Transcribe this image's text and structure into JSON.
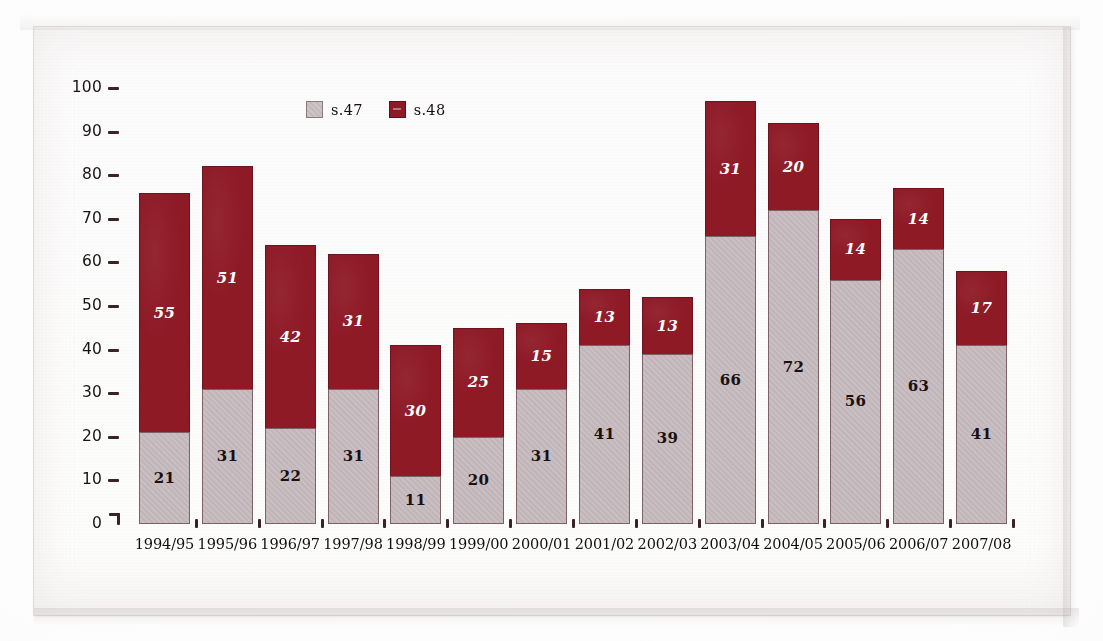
{
  "chart_data": {
    "type": "bar",
    "subtype": "stacked-bar",
    "title": "",
    "subtitle": "",
    "xlabel": "",
    "ylabel": "",
    "ylim": [
      0,
      100
    ],
    "yticks": [
      0,
      10,
      20,
      30,
      40,
      50,
      60,
      70,
      80,
      90,
      100
    ],
    "ytick_labels": [
      "0",
      "10",
      "20",
      "30",
      "40",
      "50",
      "60",
      "70",
      "80",
      "90",
      "100"
    ],
    "grid": false,
    "legend_position": "top-left-inside",
    "categories": [
      "1994/95",
      "1995/96",
      "1996/97",
      "1997/98",
      "1998/99",
      "1999/00",
      "2000/01",
      "2001/02",
      "2002/03",
      "2003/04",
      "2004/05",
      "2005/06",
      "2006/07",
      "2007/08"
    ],
    "series": [
      {
        "name": "s.47",
        "color": "#c9bfc2",
        "values": [
          21,
          31,
          22,
          31,
          11,
          20,
          31,
          41,
          39,
          66,
          72,
          56,
          63,
          41
        ]
      },
      {
        "name": "s.48",
        "color": "#8e1a26",
        "values": [
          55,
          51,
          42,
          31,
          30,
          25,
          15,
          13,
          13,
          31,
          20,
          14,
          14,
          17
        ]
      }
    ],
    "totals": [
      76,
      82,
      64,
      62,
      41,
      45,
      46,
      54,
      52,
      97,
      92,
      70,
      77,
      58
    ]
  },
  "legend": {
    "items": [
      {
        "label": "s.47",
        "swatch": "light-gray-swatch"
      },
      {
        "label": "s.48",
        "swatch": "dark-red-swatch"
      }
    ]
  },
  "colors": {
    "series_low": "#c9bfc2",
    "series_high": "#8e1a26",
    "axis": "#3a2226",
    "text": "#151010",
    "paper": "#fbfafa"
  }
}
